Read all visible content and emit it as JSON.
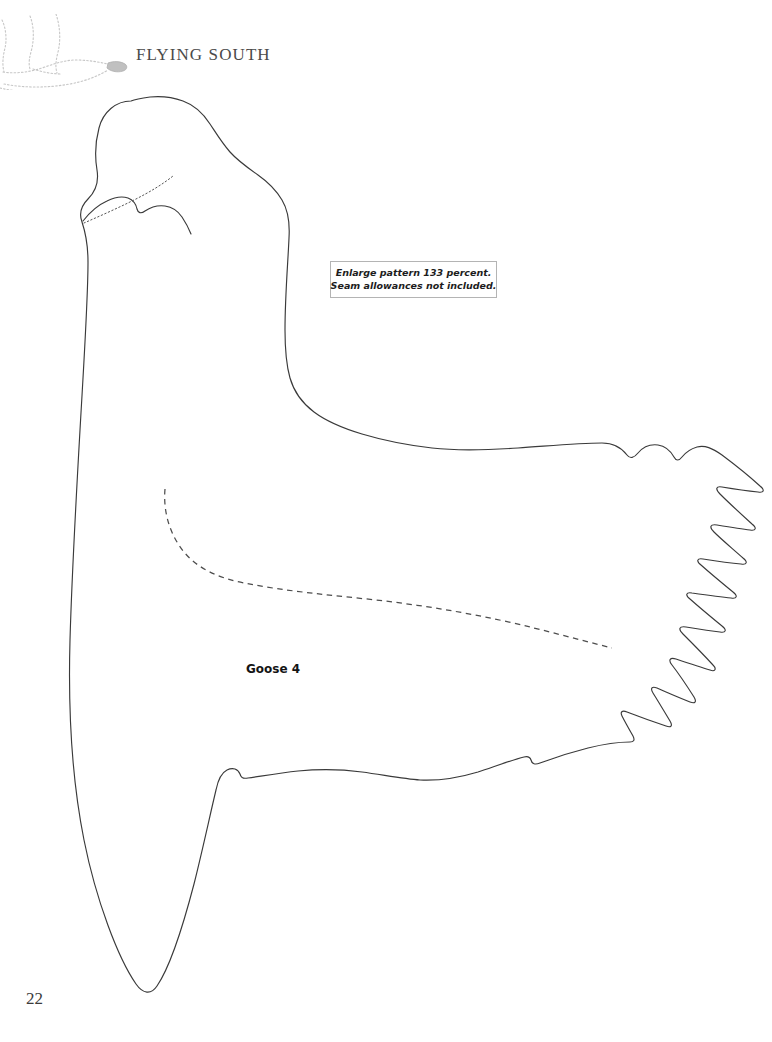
{
  "page": {
    "background_color": "#ffffff",
    "ink_color": "#3a3a3a",
    "number": "22"
  },
  "header": {
    "running_head": "FLYING SOUTH",
    "decoration_icon": "flying-goose-dotted-silhouette-icon"
  },
  "note_box": {
    "border_color": "#b4b4b4",
    "line1": "Enlarge pattern 133 percent.",
    "line2": "Seam allowances not included."
  },
  "pattern": {
    "piece_label": "Goose 4",
    "outline_icon": "goose-pattern-outline-icon",
    "cheek_patch_icon": "goose-cheek-patch-line-icon",
    "head_placement_icon": "head-placement-dotted-line-icon",
    "wing_placement_icon": "wing-placement-dashed-line-icon"
  }
}
